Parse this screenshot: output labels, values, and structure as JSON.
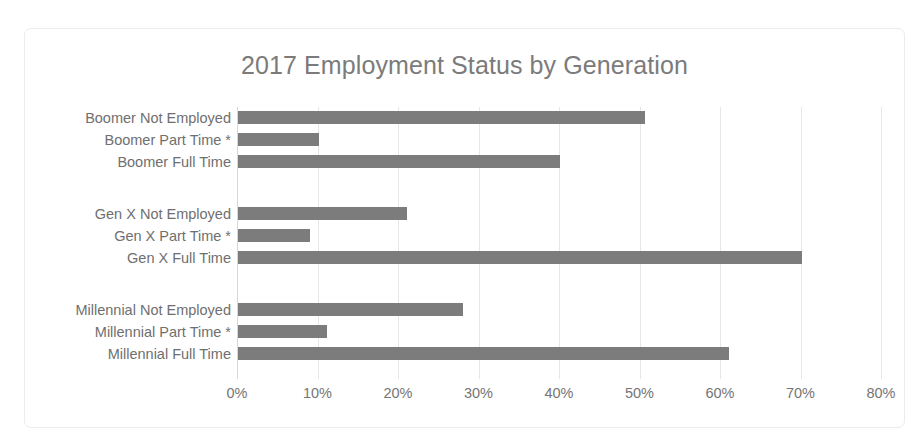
{
  "chart_data": {
    "type": "bar",
    "orientation": "horizontal",
    "title": "2017 Employment Status by Generation",
    "xlabel": "",
    "ylabel": "",
    "xlim": [
      0,
      80
    ],
    "x_tick_labels": [
      "0%",
      "10%",
      "20%",
      "30%",
      "40%",
      "50%",
      "60%",
      "70%",
      "80%"
    ],
    "x_ticks": [
      0,
      10,
      20,
      30,
      40,
      50,
      60,
      70,
      80
    ],
    "grid": "vertical",
    "legend": "none",
    "bar_color": "#7c7c7c",
    "categories": [
      "Boomer Not Employed",
      "Boomer Part Time *",
      "Boomer Full Time",
      "Gen X Not Employed",
      "Gen X Part Time *",
      "Gen X Full Time",
      "Millennial Not Employed",
      "Millennial Part Time *",
      "Millennial Full Time"
    ],
    "values": [
      50.5,
      10,
      40,
      21,
      9,
      70,
      28,
      11,
      61
    ],
    "groups": [
      {
        "name": "Boomer",
        "categories": [
          "Boomer Not Employed",
          "Boomer Part Time *",
          "Boomer Full Time"
        ],
        "values": [
          50.5,
          10,
          40
        ]
      },
      {
        "name": "Gen X",
        "categories": [
          "Gen X Not Employed",
          "Gen X Part Time *",
          "Gen X Full Time"
        ],
        "values": [
          21,
          9,
          70
        ]
      },
      {
        "name": "Millennial",
        "categories": [
          "Millennial Not Employed",
          "Millennial Part Time *",
          "Millennial Full Time"
        ],
        "values": [
          28,
          11,
          61
        ]
      }
    ]
  }
}
